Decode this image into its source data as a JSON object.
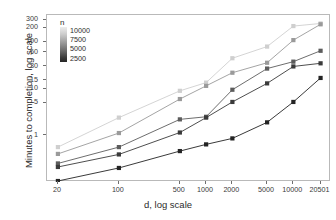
{
  "chart_data": {
    "type": "line",
    "title": "",
    "xlabel": "d, log scale",
    "ylabel": "Minutes to completion, log scale",
    "xscale": "log",
    "yscale": "log",
    "grid": false,
    "x": [
      20,
      100,
      500,
      1000,
      2000,
      5000,
      10000,
      20501
    ],
    "xticklabels": [
      "20",
      "100",
      "500",
      "1000",
      "2000",
      "5000",
      "10000",
      "20501"
    ],
    "yticks": [
      1,
      5,
      10,
      15,
      30,
      60,
      100,
      200,
      300
    ],
    "yticklabels": [
      "1",
      "5",
      "10",
      "15",
      "30",
      "60",
      "100",
      "200",
      "300"
    ],
    "ylim": [
      0.1,
      380
    ],
    "xlim": [
      15,
      27000
    ],
    "legend": {
      "title": "n",
      "type": "colorbar-gradient",
      "labels": [
        "10000",
        "7500",
        "5000",
        "2500"
      ],
      "values": [
        10000,
        7500,
        5000,
        2500
      ],
      "position": "upper-left-inside",
      "high_color": "#ededed",
      "low_color": "#262626"
    },
    "series": [
      {
        "name": "n = 10000",
        "color": "#cfcfcf",
        "values": [
          0.56,
          2.4,
          9.0,
          13.5,
          45.0,
          80.0,
          220.0,
          250.0
        ]
      },
      {
        "name": "n = 7500",
        "color": "#9a9a9a",
        "values": [
          0.4,
          1.12,
          6.0,
          11.5,
          22.0,
          36.0,
          110.0,
          240.0
        ]
      },
      {
        "name": "n = 5000",
        "color": "#5c5c5c",
        "values": [
          0.25,
          0.56,
          2.2,
          2.5,
          9.5,
          27.0,
          38.0,
          65.0
        ]
      },
      {
        "name": "n = 2500",
        "color": "#3a3a3a",
        "values": [
          0.21,
          0.39,
          1.15,
          2.4,
          5.2,
          13.0,
          30.0,
          35.0
        ]
      },
      {
        "name": "n = 2500 (lowest)",
        "color": "#242424",
        "values": [
          0.105,
          0.2,
          0.46,
          0.64,
          0.86,
          1.9,
          5.2,
          17.0
        ]
      }
    ]
  }
}
